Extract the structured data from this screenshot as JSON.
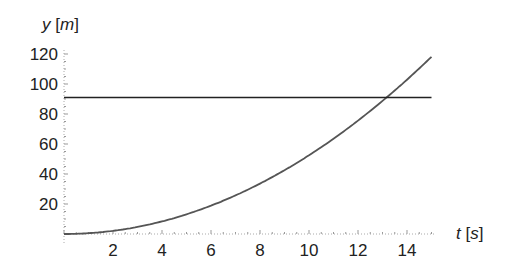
{
  "chart_data": {
    "type": "line",
    "title": "",
    "xlabel_var": "t",
    "xlabel_unit": "s",
    "ylabel_var": "y",
    "ylabel_unit": "m",
    "xlim": [
      0,
      15
    ],
    "ylim": [
      0,
      120
    ],
    "x_ticks": [
      2,
      4,
      6,
      8,
      10,
      12,
      14
    ],
    "y_ticks": [
      20,
      40,
      60,
      80,
      100,
      120
    ],
    "grid": false,
    "legend": null,
    "series": [
      {
        "name": "position curve",
        "description": "quadratic y ≈ 0.525·t²",
        "color": "#555555",
        "x": [
          0,
          1,
          2,
          3,
          4,
          5,
          6,
          7,
          8,
          9,
          10,
          11,
          12,
          13,
          14,
          15
        ],
        "values": [
          0,
          0.5,
          2.1,
          4.7,
          8.4,
          13.1,
          18.9,
          25.7,
          33.6,
          42.5,
          52.5,
          63.5,
          75.6,
          88.7,
          102.9,
          118.1
        ]
      },
      {
        "name": "horizontal line",
        "description": "constant y ≈ 91",
        "color": "#222222",
        "x": [
          0,
          15
        ],
        "values": [
          91,
          91
        ]
      }
    ],
    "annotations": [
      {
        "text": "intersection",
        "x": 13.2,
        "y": 91
      }
    ]
  }
}
